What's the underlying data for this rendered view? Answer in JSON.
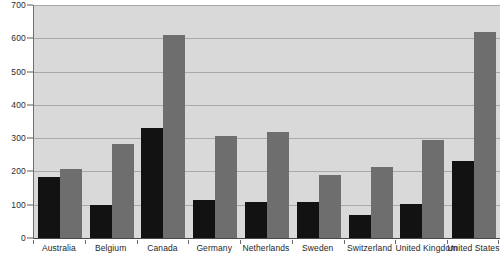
{
  "chart_data": {
    "type": "bar",
    "title": "",
    "xlabel": "",
    "ylabel": "",
    "ylim": [
      0,
      700
    ],
    "ytick_step": 100,
    "grid": true,
    "legend": "none",
    "categories": [
      "Australia",
      "Belgium",
      "Canada",
      "Germany",
      "Netherlands",
      "Sweden",
      "Switzerland",
      "United Kingdom",
      "United States"
    ],
    "ytick_labels": [
      "0",
      "100",
      "200",
      "300",
      "400",
      "500",
      "600",
      "700"
    ],
    "series": [
      {
        "name": "series-dark",
        "color": "#121212",
        "values": [
          183,
          100,
          330,
          115,
          107,
          108,
          70,
          103,
          232
        ]
      },
      {
        "name": "series-gray",
        "color": "#6e6e6e",
        "values": [
          206,
          283,
          610,
          305,
          317,
          188,
          212,
          293,
          620
        ]
      }
    ],
    "colors": {
      "plot_background": "#d9d9d9",
      "gridline": "#a9a9a9",
      "axis": "#4a4a4a",
      "page_background": "#ffffff",
      "text": "#262626"
    }
  }
}
